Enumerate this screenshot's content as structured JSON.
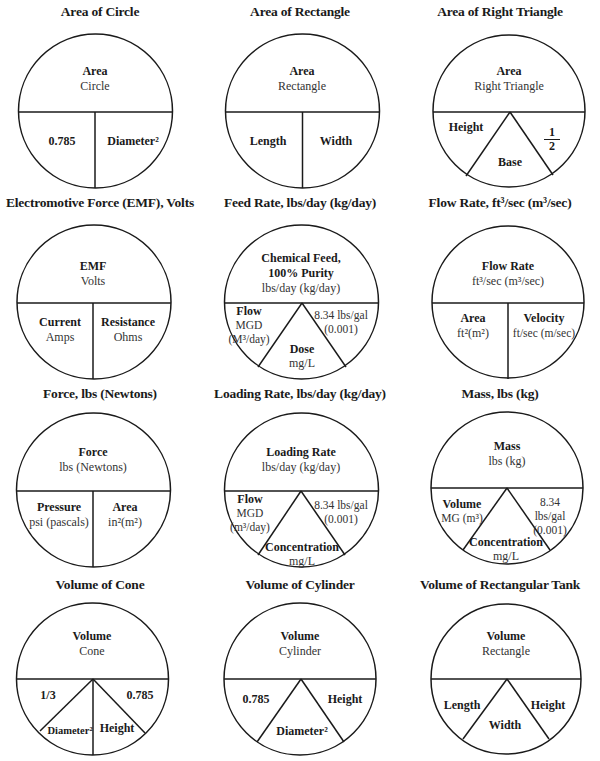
{
  "sheet": {
    "colors": {
      "line": "#1a1a1a",
      "background": "#ffffff"
    },
    "rows": [
      [
        {
          "id": "area-circle",
          "title": "Area of Circle",
          "top_bold": "Area",
          "top_sub": "Circle",
          "layout": "split2",
          "parts": [
            {
              "bold": "0.785",
              "sub": ""
            },
            {
              "bold": "Diameter²",
              "sub": ""
            }
          ]
        },
        {
          "id": "area-rectangle",
          "title": "Area of Rectangle",
          "top_bold": "Area",
          "top_sub": "Rectangle",
          "layout": "split2",
          "parts": [
            {
              "bold": "Length",
              "sub": ""
            },
            {
              "bold": "Width",
              "sub": ""
            }
          ]
        },
        {
          "id": "area-right-triangle",
          "title": "Area of Right Triangle",
          "top_bold": "Area",
          "top_sub": "Right Triangle",
          "layout": "split3",
          "parts": [
            {
              "bold": "Height",
              "sub": ""
            },
            {
              "bold": "Base",
              "sub": ""
            },
            {
              "fraction": [
                "1",
                "2"
              ]
            }
          ]
        }
      ],
      [
        {
          "id": "emf",
          "title": "Electromotive Force (EMF), Volts",
          "top_bold": "EMF",
          "top_sub": "Volts",
          "layout": "split2",
          "parts": [
            {
              "bold": "Current",
              "sub": "Amps"
            },
            {
              "bold": "Resistance",
              "sub": "Ohms"
            }
          ]
        },
        {
          "id": "feed-rate",
          "title": "Feed Rate, lbs/day (kg/day)",
          "top_bold": "Chemical Feed,\n100% Purity",
          "top_sub": "lbs/day (kg/day)",
          "layout": "split3",
          "parts": [
            {
              "bold": "Flow",
              "sub": "MGD\n(M³/day)"
            },
            {
              "bold": "Dose",
              "sub": "mg/L"
            },
            {
              "bold": "",
              "sub": "8.34 lbs/gal\n(0.001)"
            }
          ]
        },
        {
          "id": "flow-rate",
          "title": "Flow Rate, ft³/sec (m³/sec)",
          "top_bold": "Flow Rate",
          "top_sub": "ft³/sec (m³/sec)",
          "layout": "split2",
          "parts": [
            {
              "bold": "Area",
              "sub": "ft²(m²)"
            },
            {
              "bold": "Velocity",
              "sub": "ft/sec (m/sec)"
            }
          ]
        }
      ],
      [
        {
          "id": "force",
          "title": "Force, lbs (Newtons)",
          "top_bold": "Force",
          "top_sub": "lbs (Newtons)",
          "layout": "split2",
          "parts": [
            {
              "bold": "Pressure",
              "sub": "psi (pascals)"
            },
            {
              "bold": "Area",
              "sub": "in²(m²)"
            }
          ]
        },
        {
          "id": "loading-rate",
          "title": "Loading Rate, lbs/day (kg/day)",
          "top_bold": "Loading Rate",
          "top_sub": "lbs/day (kg/day)",
          "layout": "split3",
          "parts": [
            {
              "bold": "Flow",
              "sub": "MGD\n(m³/day)"
            },
            {
              "bold": "Concentration",
              "sub": "mg/L"
            },
            {
              "bold": "",
              "sub": "8.34 lbs/gal\n(0.001)"
            }
          ]
        },
        {
          "id": "mass",
          "title": "Mass, lbs (kg)",
          "top_bold": "Mass",
          "top_sub": "lbs (kg)",
          "layout": "split3",
          "parts": [
            {
              "bold": "Volume",
              "sub": "MG (m³)"
            },
            {
              "bold": "Concentration",
              "sub": "mg/L"
            },
            {
              "bold": "",
              "sub": "8.34 lbs/gal\n(0.001)"
            }
          ]
        }
      ],
      [
        {
          "id": "volume-cone",
          "title": "Volume of Cone",
          "top_bold": "Volume",
          "top_sub": "Cone",
          "layout": "split4",
          "parts": [
            {
              "bold": "1/3",
              "sub": ""
            },
            {
              "bold": "Diameter²",
              "sub": ""
            },
            {
              "bold": "Height",
              "sub": ""
            },
            {
              "bold": "0.785",
              "sub": ""
            }
          ]
        },
        {
          "id": "volume-cylinder",
          "title": "Volume of Cylinder",
          "top_bold": "Volume",
          "top_sub": "Cylinder",
          "layout": "split3",
          "parts": [
            {
              "bold": "0.785",
              "sub": ""
            },
            {
              "bold": "Diameter²",
              "sub": ""
            },
            {
              "bold": "Height",
              "sub": ""
            }
          ]
        },
        {
          "id": "volume-rect-tank",
          "title": "Volume of Rectangular Tank",
          "top_bold": "Volume",
          "top_sub": "Rectangle",
          "layout": "split3",
          "parts": [
            {
              "bold": "Length",
              "sub": ""
            },
            {
              "bold": "Width",
              "sub": ""
            },
            {
              "bold": "Height",
              "sub": ""
            }
          ]
        }
      ]
    ]
  }
}
